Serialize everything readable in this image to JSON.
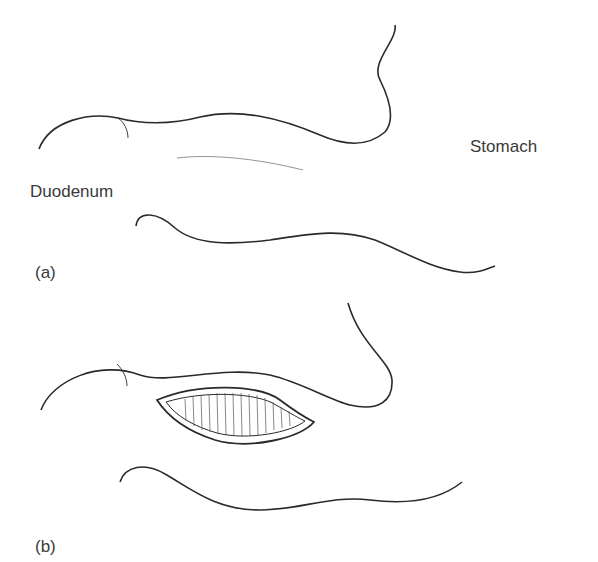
{
  "panels": [
    {
      "id": "a",
      "label": "(a)",
      "labels": {
        "duodenum": "Duodenum",
        "stomach": "Stomach"
      }
    },
    {
      "id": "b",
      "label": "(b)",
      "description": "Incision opened across pylorus showing mucosal folds"
    }
  ],
  "colors": {
    "line": "#2a2a2a",
    "light_line": "#888888"
  }
}
